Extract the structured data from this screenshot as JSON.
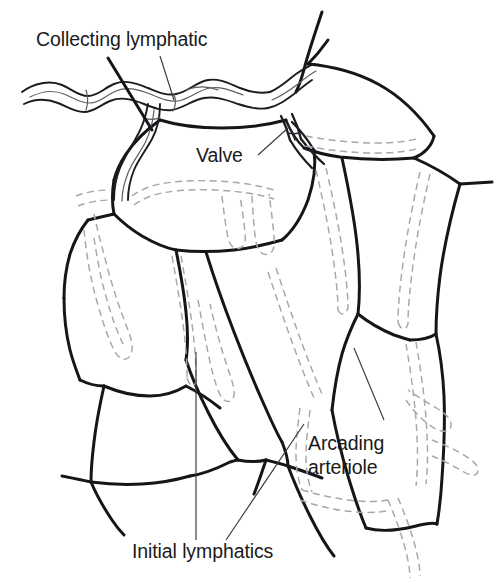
{
  "figure": {
    "background_color": "#ffffff",
    "width": 500,
    "height": 586,
    "style": "line drawing, black ink on white, dashed gray overlay"
  },
  "labels": {
    "collecting_lymphatic": "Collecting lymphatic",
    "valve": "Valve",
    "arcading_arteriole_line1": "Arcading",
    "arcading_arteriole_line2": "arteriole",
    "initial_lymphatics": "Initial lymphatics"
  },
  "colors": {
    "ink": "#16161a",
    "ink_mid": "#1c1c20",
    "dashed_gray": "#a6a6ab",
    "leader_gray": "#3a3a3f",
    "text": "#1a1a1a",
    "background": "#ffffff"
  },
  "legend_semantics": {
    "solid_black_lines": "arcading arteriole and venule network outlines",
    "dashed_gray_lines": "initial lymphatics (blind-ended lymphatic capillaries)",
    "beaded_vessel_top": "collecting lymphatic vessel with lymphangion segments",
    "notch_at_junction": "bicuspid valve within collecting lymphatic"
  },
  "geometry": {
    "collecting_lymphatic_path": "M 14 98 C 30 89 48 88 62 93 C 76 98 84 106 98 105 C 112 104 120 94 134 90 C 150 86 164 92 178 92 C 194 92 206 85 222 85 C 238 85 250 92 264 94 C 276 96 286 92 296 86",
    "collecting_lymphatic_lower": "M 14 106 C 32 100 46 101 58 105 C 72 110 80 116 96 115 C 112 114 122 104 136 101 C 152 98 166 103 180 103 C 196 103 208 97 222 97 C 236 97 248 103 262 105",
    "valve_marker": "notch pair near x=285,y=120",
    "leaders": {
      "collecting_lymphatic_leader": "M 160 60 L 172 100",
      "valve_leader": "M 258 155 L 290 131",
      "arcading_leader": "M 385 418 L 356 347",
      "initial_lymphatics_leader_left": "M 196 538 L 196 360",
      "initial_lymphatics_leader_right": "M 230 538 L 303 425"
    }
  },
  "text_positions": {
    "collecting_lymphatic": {
      "x": 36,
      "y": 46
    },
    "valve": {
      "x": 196,
      "y": 162
    },
    "arcading_arteriole": {
      "x": 308,
      "y": 450
    },
    "initial_lymphatics": {
      "x": 132,
      "y": 558
    }
  }
}
